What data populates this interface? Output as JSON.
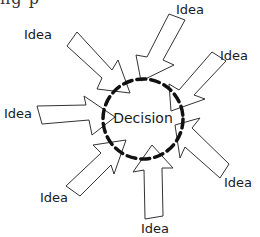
{
  "diagram": {
    "type": "convergence",
    "cutoff_text": "ng  p",
    "center": {
      "label": "Decision",
      "shape": "dashed-circle",
      "cx": 143,
      "cy": 119,
      "r": 40,
      "stroke_color": "#111111"
    },
    "arrow_style": {
      "fill": "#ffffff",
      "stroke": "#333333"
    },
    "ideas": [
      {
        "label": "Idea",
        "label_x": 38,
        "label_y": 34
      },
      {
        "label": "Idea",
        "label_x": 190,
        "label_y": 9
      },
      {
        "label": "Idea",
        "label_x": 234,
        "label_y": 55
      },
      {
        "label": "Idea",
        "label_x": 18,
        "label_y": 113
      },
      {
        "label": "Idea",
        "label_x": 238,
        "label_y": 182
      },
      {
        "label": "Idea",
        "label_x": 54,
        "label_y": 197
      },
      {
        "label": "Idea",
        "label_x": 155,
        "label_y": 228
      }
    ]
  }
}
